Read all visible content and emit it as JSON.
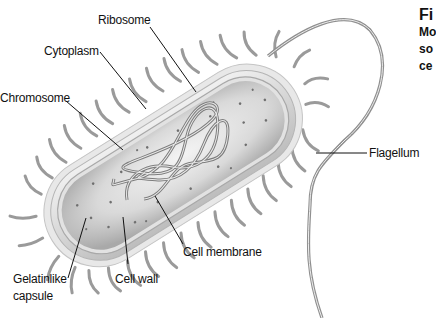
{
  "figure": {
    "caption": {
      "title_fragment": "Fi",
      "lines": [
        "Mo",
        "so",
        "ce"
      ]
    },
    "labels": {
      "ribosome": "Ribosome",
      "cytoplasm": "Cytoplasm",
      "chromosome": "Chromosome",
      "flagellum": "Flagellum",
      "cell_membrane": "Cell membrane",
      "cell_wall": "Cell wall",
      "capsule_line1": "Gelatinlike",
      "capsule_line2": "capsule"
    },
    "colors": {
      "background": "#ffffff",
      "capsule": "#e4e4e4",
      "wall": "#d6d6d6",
      "cytoplasm": "#cfcfcf",
      "strand": "#8a8a8a",
      "leader": "#111111"
    }
  }
}
